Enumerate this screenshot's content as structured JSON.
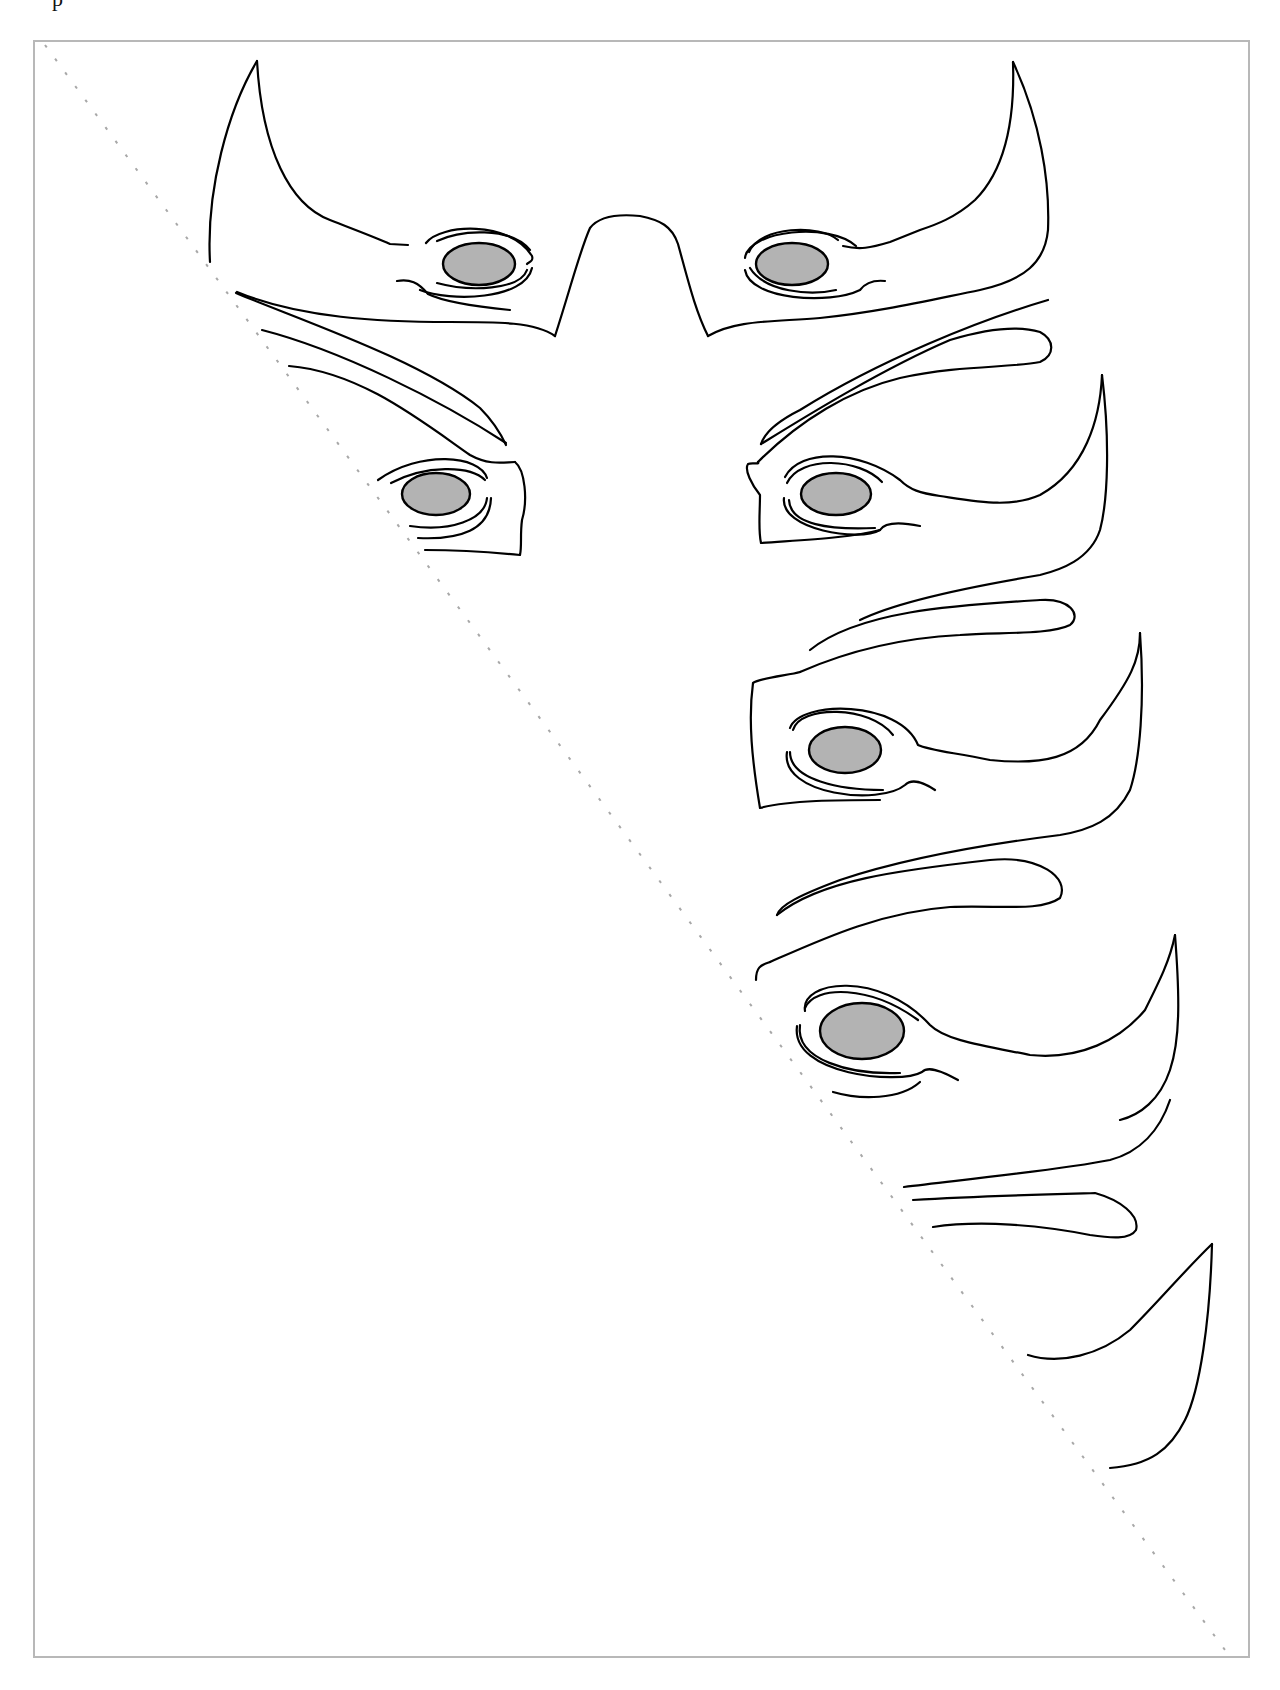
{
  "page": {
    "header_fragment": "p"
  },
  "diagram": {
    "type": "cut-out template",
    "frame_color": "#b8b8b8",
    "fold_line": {
      "style": "dashed",
      "color": "#a8a8a8",
      "from": [
        45,
        45
      ],
      "to": [
        1225,
        1650
      ]
    },
    "eye_fill_color": "#b3b3b3",
    "line_color": "#000000",
    "shapes": [
      {
        "id": "mask-front",
        "label": "front mask with two eyes and nose bridge",
        "eyes": 2
      },
      {
        "id": "mask-side-1",
        "label": "split side profile row 1",
        "eyes": 2
      },
      {
        "id": "mask-side-2",
        "label": "side profile row 2",
        "eyes": 1
      },
      {
        "id": "mask-side-3",
        "label": "side profile row 3",
        "eyes": 1
      },
      {
        "id": "mask-side-4",
        "label": "partial tail shapes",
        "eyes": 0
      }
    ]
  }
}
